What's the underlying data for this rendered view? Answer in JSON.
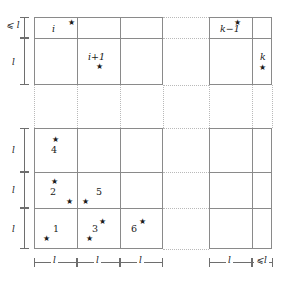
{
  "figure": {
    "colors": {
      "grid_line": "#8a8a8a",
      "dotted_line": "#b9b9b9",
      "text": "#1a1a1a",
      "measure_line": "#6e6e6e",
      "background": "#ffffff"
    },
    "star_glyph": "★"
  },
  "labels": {
    "l": "l",
    "le_l": "⩽ l",
    "le_l_tight": "⩽l"
  },
  "upper_block": {
    "cells": [
      {
        "id": "cell-i",
        "label": "i",
        "italic": true
      },
      {
        "id": "cell-i-plus-1",
        "label": "i+1",
        "italic": true
      },
      {
        "id": "cell-k-minus-1",
        "label": "k−1",
        "italic": true
      },
      {
        "id": "cell-k",
        "label": "k",
        "italic": true
      }
    ],
    "row_measures": [
      {
        "id": "upper-row-1",
        "label": "⩽ l"
      },
      {
        "id": "upper-row-2",
        "label": "l"
      }
    ]
  },
  "lower_block": {
    "cells": [
      {
        "id": "cell-4",
        "label": "4"
      },
      {
        "id": "cell-2",
        "label": "2"
      },
      {
        "id": "cell-5",
        "label": "5"
      },
      {
        "id": "cell-1",
        "label": "1"
      },
      {
        "id": "cell-3",
        "label": "3"
      },
      {
        "id": "cell-6",
        "label": "6"
      }
    ],
    "row_measures": [
      {
        "id": "lower-row-1",
        "label": "l"
      },
      {
        "id": "lower-row-2",
        "label": "l"
      },
      {
        "id": "lower-row-3",
        "label": "l"
      }
    ],
    "column_measures": [
      {
        "id": "col-1",
        "label": "l"
      },
      {
        "id": "col-2",
        "label": "l"
      },
      {
        "id": "col-3",
        "label": "l"
      },
      {
        "id": "col-right-1",
        "label": "l"
      },
      {
        "id": "col-right-2",
        "label": "⩽l"
      }
    ]
  },
  "stars": {
    "upper": [
      {
        "id": "star-cell-i"
      },
      {
        "id": "star-cell-i-plus-1"
      },
      {
        "id": "star-cell-k-minus-1"
      },
      {
        "id": "star-cell-k"
      }
    ],
    "lower": [
      {
        "id": "star-cell-4"
      },
      {
        "id": "star-cell-2-top"
      },
      {
        "id": "star-cell-2-bottom"
      },
      {
        "id": "star-cell-5"
      },
      {
        "id": "star-cell-1"
      },
      {
        "id": "star-cell-3-top"
      },
      {
        "id": "star-cell-3-bottom"
      },
      {
        "id": "star-cell-6"
      }
    ]
  }
}
